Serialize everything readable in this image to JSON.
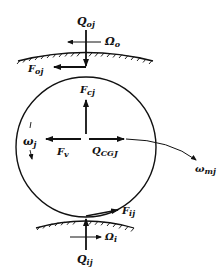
{
  "diagram": {
    "type": "free-body diagram of rolling element (ball) between races",
    "labels": {
      "Q_oj": {
        "main": "Q",
        "sub": "oj"
      },
      "Omega_o": {
        "main": "Ω",
        "sub": "o"
      },
      "F_oj": {
        "main": "F",
        "sub": "oj"
      },
      "F_cj": {
        "main": "F",
        "sub": "cj"
      },
      "omega_j": {
        "main": "ω",
        "sub": "j"
      },
      "F_v": {
        "main": "F",
        "sub": "v"
      },
      "Q_CGJ": {
        "main": "Q",
        "sub": "CGJ"
      },
      "omega_mj": {
        "main": "ω",
        "sub": "mj"
      },
      "F_ij": {
        "main": "F",
        "sub": "ij"
      },
      "Omega_i": {
        "main": "Ω",
        "sub": "i"
      },
      "Q_ij": {
        "main": "Q",
        "sub": "ij"
      }
    },
    "colors": {
      "stroke": "#111111",
      "background": "#ffffff"
    }
  }
}
